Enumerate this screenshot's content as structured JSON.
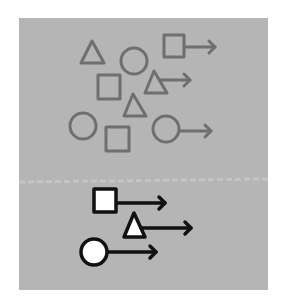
{
  "diagram": {
    "background_color": "#ffffff",
    "panel": {
      "x": 19,
      "y": 18,
      "width": 249,
      "height": 272,
      "color": "#b5b5b5"
    },
    "divider": {
      "y": 182,
      "color": "#c9c9c9"
    },
    "top_group": {
      "stroke_color": "#6f6f6f",
      "fill": "none",
      "shapes": [
        {
          "type": "triangle",
          "points": "92,41 81,63 104,63",
          "arrow": null
        },
        {
          "type": "circle",
          "cx": 134,
          "cy": 61,
          "r": 13,
          "arrow": null
        },
        {
          "type": "square",
          "x": 164,
          "y": 35,
          "w": 20,
          "h": 22,
          "arrow": {
            "x1": 184,
            "y1": 47,
            "x2": 215,
            "y2": 47
          }
        },
        {
          "type": "square",
          "x": 98,
          "y": 75,
          "w": 22,
          "h": 24,
          "arrow": null
        },
        {
          "type": "triangle",
          "points": "154,71 145,93 167,93",
          "arrow": {
            "x1": 160,
            "y1": 80,
            "x2": 190,
            "y2": 80
          }
        },
        {
          "type": "triangle",
          "points": "133,94 124,116 146,116",
          "arrow": null
        },
        {
          "type": "circle",
          "cx": 83,
          "cy": 126,
          "r": 13,
          "arrow": null
        },
        {
          "type": "square",
          "x": 106,
          "y": 127,
          "w": 23,
          "h": 24,
          "arrow": null
        },
        {
          "type": "circle",
          "cx": 166,
          "cy": 129,
          "r": 13,
          "arrow": {
            "x1": 179,
            "y1": 131,
            "x2": 211,
            "y2": 131
          }
        }
      ]
    },
    "bottom_group": {
      "stroke_color": "#111111",
      "fill": "#ffffff",
      "shapes": [
        {
          "type": "square",
          "x": 94,
          "y": 189,
          "w": 22,
          "h": 23,
          "arrow": {
            "x1": 116,
            "y1": 203,
            "x2": 165,
            "y2": 203
          }
        },
        {
          "type": "triangle",
          "points": "134,213 124,237 145,237",
          "arrow": {
            "x1": 142,
            "y1": 228,
            "x2": 191,
            "y2": 228
          }
        },
        {
          "type": "circle",
          "cx": 94,
          "cy": 252,
          "r": 13,
          "arrow": {
            "x1": 107,
            "y1": 252,
            "x2": 156,
            "y2": 252
          }
        }
      ]
    }
  }
}
